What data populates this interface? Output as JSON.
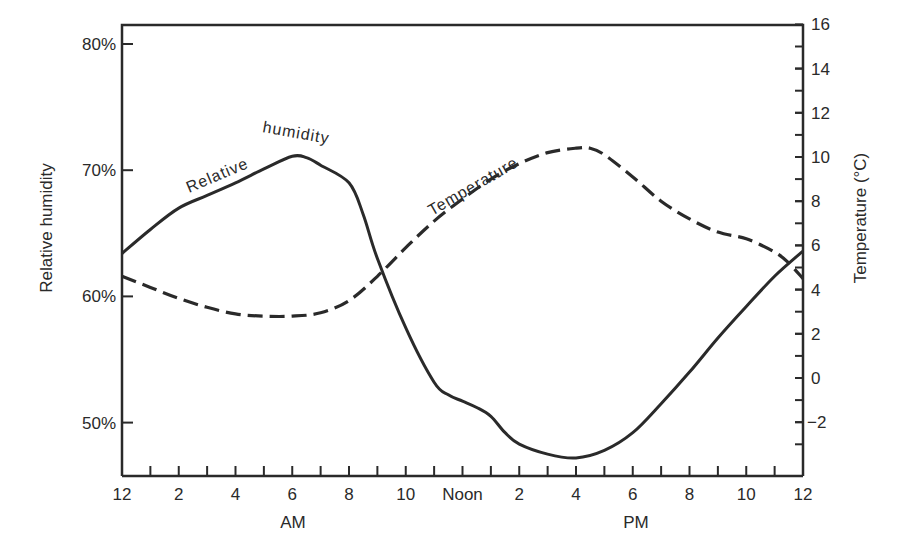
{
  "chart_data": {
    "type": "line",
    "title": "",
    "xlabel_left": "AM",
    "xlabel_right": "PM",
    "ylabel": "Relative humidity",
    "y2label": "Temperature (°C)",
    "x_ticks": [
      "12",
      "2",
      "4",
      "6",
      "8",
      "10",
      "Noon",
      "2",
      "4",
      "6",
      "8",
      "10",
      "12"
    ],
    "x_tick_hours": [
      0,
      2,
      4,
      6,
      8,
      10,
      12,
      14,
      16,
      18,
      20,
      22,
      24
    ],
    "y_ticks": [
      "50%",
      "60%",
      "70%",
      "80%"
    ],
    "y_tick_values": [
      50,
      60,
      70,
      80
    ],
    "y2_ticks": [
      "−2",
      "0",
      "2",
      "4",
      "6",
      "8",
      "10",
      "12",
      "14",
      "16"
    ],
    "y2_tick_values": [
      -2,
      0,
      2,
      4,
      6,
      8,
      10,
      12,
      14,
      16
    ],
    "xlim": [
      0,
      24
    ],
    "ylim": [
      45.5,
      82.5
    ],
    "y2lim": [
      -4.2,
      16
    ],
    "grid": false,
    "legend": "inline curve labels",
    "series": [
      {
        "name": "Relative humidity",
        "label_text": [
          "Relative",
          "humidity"
        ],
        "axis": "left",
        "style": "solid",
        "unit": "%",
        "x": [
          0,
          1,
          2,
          3,
          4,
          5,
          6,
          6.5,
          7,
          8,
          8.5,
          9,
          10,
          11,
          11.5,
          12,
          12.5,
          13,
          13.5,
          14,
          15,
          16,
          17,
          18,
          19,
          20,
          21,
          22,
          23,
          24
        ],
        "values": [
          63.4,
          65.3,
          67.0,
          68.0,
          69.0,
          70.1,
          71.1,
          71.0,
          70.4,
          69.0,
          66.5,
          63.0,
          57.5,
          53.2,
          52.2,
          51.7,
          51.2,
          50.5,
          49.2,
          48.3,
          47.5,
          47.2,
          47.8,
          49.2,
          51.5,
          54.0,
          56.7,
          59.2,
          61.6,
          63.6
        ]
      },
      {
        "name": "Temperature",
        "label_text": [
          "Temperature"
        ],
        "axis": "right",
        "style": "dashed",
        "unit": "°C",
        "x": [
          0,
          1,
          2,
          3,
          4,
          5,
          6,
          7,
          8,
          9,
          10,
          11,
          12,
          13,
          14,
          15,
          16,
          16.5,
          17,
          18,
          19,
          20,
          21,
          22,
          23,
          23.5,
          24
        ],
        "values": [
          4.6,
          4.1,
          3.6,
          3.2,
          2.9,
          2.8,
          2.8,
          2.95,
          3.5,
          4.6,
          5.9,
          7.1,
          8.1,
          9.0,
          9.7,
          10.2,
          10.4,
          10.4,
          10.1,
          9.1,
          8.0,
          7.2,
          6.6,
          6.3,
          5.7,
          5.2,
          4.5
        ]
      }
    ]
  }
}
